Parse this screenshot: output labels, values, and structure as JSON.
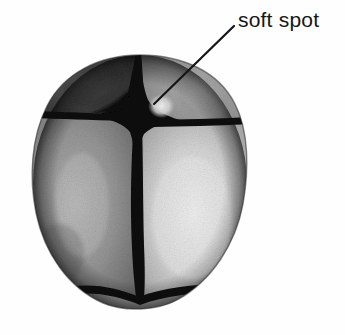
{
  "figure": {
    "name": "infant-skull-superior-view",
    "caption_text": "",
    "background_color": "#fefefe"
  },
  "annotations": [
    {
      "id": "soft-spot",
      "label": "soft spot",
      "label_x": 238,
      "label_y": 9,
      "leader_from_x": 234,
      "leader_from_y": 26,
      "leader_to_x": 154,
      "leader_to_y": 104,
      "leader_color": "#151515",
      "leader_width": 2.2
    }
  ],
  "illustration": {
    "type": "halftone-grayscale-anatomical-drawing",
    "subject": "neonatal cranium viewed from above",
    "outline": {
      "center_x": 140,
      "center_y": 183,
      "radius_x": 107,
      "radius_y": 128,
      "top_y": 55,
      "bottom_y": 311,
      "left_x": 33,
      "right_x": 247
    },
    "regions": [
      {
        "name": "frontal-bone-left",
        "tone": "#3d3d3d",
        "description": "dark upper-left quadrant"
      },
      {
        "name": "frontal-bone-right",
        "tone": "#9c9c9c",
        "description": "mid-gray upper-right quadrant"
      },
      {
        "name": "parietal-bone-left",
        "tone": "#8e8e8e",
        "description": "medium gray lower-left quadrant"
      },
      {
        "name": "parietal-bone-right",
        "tone": "#d2d2d2",
        "description": "light gray lower-right quadrant"
      },
      {
        "name": "anterior-fontanelle",
        "tone": "#0f0f0f",
        "description": "dark diamond-shaped soft spot at suture junction"
      },
      {
        "name": "soft-spot-highlight",
        "tone": "#e8e8e8",
        "description": "pale highlight patch adjacent to fontanelle where the leader line terminates"
      }
    ],
    "sutures": [
      {
        "name": "sagittal-suture",
        "orientation": "vertical",
        "color": "#101010"
      },
      {
        "name": "coronal-suture",
        "orientation": "horizontal",
        "color": "#101010"
      },
      {
        "name": "lambdoid-suture",
        "orientation": "inverted-v",
        "color": "#101010"
      }
    ]
  }
}
